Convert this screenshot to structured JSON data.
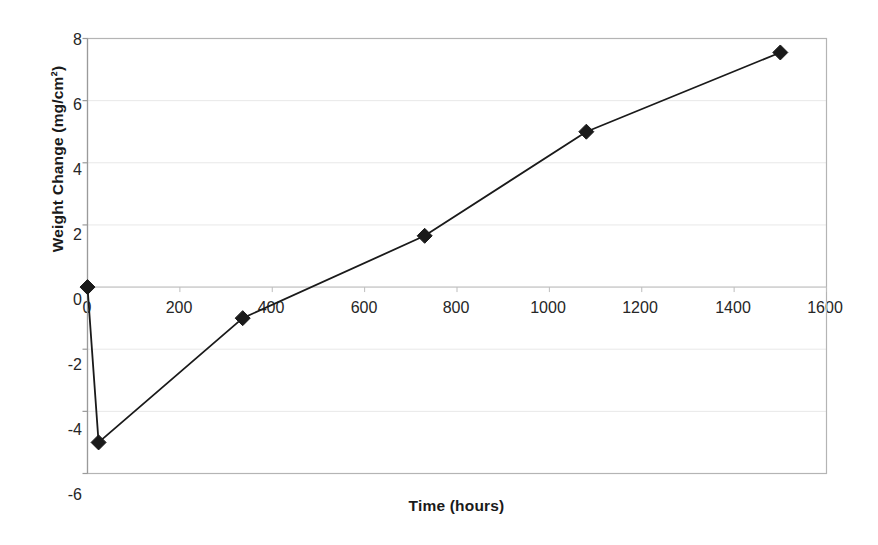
{
  "chart_data": {
    "type": "line",
    "title": "",
    "xlabel": "Time (hours)",
    "ylabel": "Weight Change (mg/cm²)",
    "xlim": [
      0,
      1600
    ],
    "ylim": [
      -6,
      8
    ],
    "xticks": [
      0,
      200,
      400,
      600,
      800,
      1000,
      1200,
      1400,
      1600
    ],
    "yticks": [
      8,
      6,
      4,
      2,
      0,
      -2,
      -4,
      -6
    ],
    "grid": "horizontal-faint",
    "legend": "none",
    "marker": "filled-diamond",
    "line_color": "#1a1a1a",
    "marker_color": "#1a1a1a",
    "series": [
      {
        "name": "Weight Change",
        "points": [
          {
            "x": 0,
            "y": 0.0
          },
          {
            "x": 24,
            "y": -5.0
          },
          {
            "x": 336,
            "y": -1.0
          },
          {
            "x": 730,
            "y": 1.65
          },
          {
            "x": 1080,
            "y": 5.0
          },
          {
            "x": 1500,
            "y": 7.55
          }
        ]
      }
    ]
  },
  "axis": {
    "y_tick_labels": [
      "8",
      "6",
      "4",
      "2",
      "0",
      "-2",
      "-4",
      "-6"
    ],
    "x_tick_labels": [
      "0",
      "200",
      "400",
      "600",
      "800",
      "1000",
      "1200",
      "1400",
      "1600"
    ],
    "x_title": "Time (hours)",
    "y_title": "Weight Change (mg/cm²)"
  },
  "colors": {
    "plot_border": "#b4b4b4",
    "gridline": "#e8e8e8",
    "series": "#1a1a1a",
    "background": "#ffffff",
    "text": "#262626"
  }
}
